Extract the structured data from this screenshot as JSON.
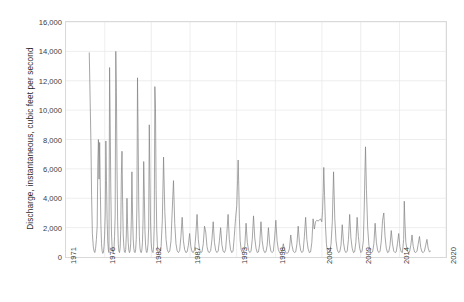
{
  "chart_data": {
    "type": "line",
    "title": "",
    "xlabel": "",
    "ylabel": "Discharge, instantaneous, cubic feet per second",
    "ylim": [
      0,
      16000
    ],
    "xlim": [
      1971,
      2020
    ],
    "grid": true,
    "legend": false,
    "legend_position": "none",
    "line_color": "#808080",
    "y_ticks": [
      "16,000",
      "14,000",
      "12,000",
      "10,000",
      "8,000",
      "6,000",
      "4,000",
      "2,000",
      "0"
    ],
    "y_tick_values": [
      16000,
      14000,
      12000,
      10000,
      8000,
      6000,
      4000,
      2000,
      0
    ],
    "x_ticks": [
      "1971",
      "1976",
      "1982",
      "1987",
      "1993",
      "1998",
      "2004",
      "2009",
      "2014",
      "2020"
    ],
    "x_tick_values": [
      1971,
      1976,
      1982,
      1987,
      1993,
      1998,
      2004,
      2009,
      2014,
      2020
    ],
    "series": [
      {
        "name": "Discharge, instantaneous",
        "x": [
          1974.0,
          1974.12,
          1974.22,
          1974.3,
          1974.4,
          1974.52,
          1974.62,
          1974.72,
          1974.82,
          1974.92,
          1975.02,
          1975.1,
          1975.18,
          1975.26,
          1975.34,
          1975.42,
          1975.5,
          1975.58,
          1975.66,
          1975.74,
          1975.82,
          1975.9,
          1975.98,
          1976.06,
          1976.14,
          1976.22,
          1976.3,
          1976.38,
          1976.46,
          1976.54,
          1976.62,
          1976.7,
          1976.78,
          1976.86,
          1976.94,
          1977.02,
          1977.1,
          1977.18,
          1977.26,
          1977.34,
          1977.42,
          1977.5,
          1977.58,
          1977.66,
          1977.74,
          1977.82,
          1977.9,
          1977.98,
          1978.06,
          1978.14,
          1978.22,
          1978.3,
          1978.38,
          1978.46,
          1978.54,
          1978.62,
          1978.7,
          1978.78,
          1978.86,
          1978.94,
          1979.02,
          1979.1,
          1979.18,
          1979.26,
          1979.34,
          1979.42,
          1979.5,
          1979.58,
          1979.66,
          1979.74,
          1979.82,
          1979.9,
          1979.98,
          1980.06,
          1980.14,
          1980.22,
          1980.3,
          1980.38,
          1980.46,
          1980.54,
          1980.62,
          1980.7,
          1980.78,
          1980.86,
          1980.94,
          1981.02,
          1981.1,
          1981.18,
          1981.26,
          1981.34,
          1981.42,
          1981.5,
          1981.58,
          1981.66,
          1981.74,
          1981.82,
          1981.9,
          1981.98,
          1982.06,
          1982.14,
          1982.22,
          1982.3,
          1982.38,
          1982.46,
          1982.54,
          1982.62,
          1982.7,
          1982.78,
          1982.86,
          1982.94,
          1983.1,
          1983.26,
          1983.42,
          1983.58,
          1983.74,
          1983.9,
          1984.06,
          1984.22,
          1984.38,
          1984.54,
          1984.7,
          1984.86,
          1985.02,
          1985.18,
          1985.34,
          1985.5,
          1985.66,
          1985.82,
          1985.98,
          1986.14,
          1986.3,
          1986.46,
          1986.62,
          1986.78,
          1986.94,
          1987.1,
          1987.26,
          1987.42,
          1987.58,
          1987.74,
          1987.9,
          1988.06,
          1988.22,
          1988.38,
          1988.54,
          1988.7,
          1988.86,
          1989.02,
          1989.18,
          1989.34,
          1989.5,
          1989.66,
          1989.82,
          1989.98,
          1990.14,
          1990.3,
          1990.46,
          1990.62,
          1990.78,
          1990.94,
          1991.1,
          1991.26,
          1991.42,
          1991.58,
          1991.74,
          1991.9,
          1992.06,
          1992.22,
          1992.38,
          1992.54,
          1992.7,
          1992.86,
          1993.02,
          1993.12,
          1993.2,
          1993.28,
          1993.36,
          1993.46,
          1993.58,
          1993.74,
          1993.9,
          1994.06,
          1994.22,
          1994.38,
          1994.54,
          1994.7,
          1994.86,
          1995.02,
          1995.18,
          1995.34,
          1995.5,
          1995.66,
          1995.82,
          1995.98,
          1996.14,
          1996.3,
          1996.46,
          1996.62,
          1996.78,
          1996.94,
          1997.1,
          1997.26,
          1997.42,
          1997.58,
          1997.74,
          1997.9,
          1998.06,
          1998.22,
          1998.38,
          1998.54,
          1998.7,
          1998.86,
          1999.02,
          1999.18,
          1999.34,
          1999.5,
          1999.66,
          1999.82,
          1999.98,
          2000.14,
          2000.3,
          2000.46,
          2000.62,
          2000.78,
          2000.94,
          2001.1,
          2001.26,
          2001.42,
          2001.58,
          2001.74,
          2001.9,
          2002.06,
          2002.22,
          2002.38,
          2002.54,
          2002.7,
          2002.86,
          2003.02,
          2003.18,
          2003.34,
          2003.5,
          2003.66,
          2003.82,
          2003.98,
          2004.08,
          2004.16,
          2004.24,
          2004.34,
          2004.46,
          2004.58,
          2004.7,
          2004.86,
          2005.02,
          2005.18,
          2005.34,
          2005.5,
          2005.66,
          2005.82,
          2005.98,
          2006.14,
          2006.3,
          2006.46,
          2006.62,
          2006.78,
          2006.94,
          2007.1,
          2007.26,
          2007.42,
          2007.58,
          2007.74,
          2007.9,
          2008.06,
          2008.22,
          2008.38,
          2008.54,
          2008.7,
          2008.86,
          2009.02,
          2009.18,
          2009.34,
          2009.46,
          2009.54,
          2009.62,
          2009.74,
          2009.9,
          2010.06,
          2010.22,
          2010.38,
          2010.54,
          2010.7,
          2010.86,
          2011.02,
          2011.18,
          2011.34,
          2011.5,
          2011.66,
          2011.82,
          2011.98,
          2012.14,
          2012.3,
          2012.46,
          2012.62,
          2012.78,
          2012.94,
          2013.1,
          2013.26,
          2013.42,
          2013.58,
          2013.74,
          2013.9,
          2014.06,
          2014.22,
          2014.38,
          2014.54,
          2014.62,
          2014.7,
          2014.82,
          2014.98,
          2015.14,
          2015.3,
          2015.46,
          2015.62,
          2015.78,
          2015.94,
          2016.1,
          2016.26,
          2016.42,
          2016.58,
          2016.74,
          2016.9,
          2017.06,
          2017.22,
          2017.38,
          2017.54,
          2017.7,
          2017.86,
          2018.0
        ],
        "y": [
          13900,
          10500,
          7600,
          4200,
          1600,
          700,
          400,
          300,
          600,
          1200,
          2100,
          6200,
          8000,
          5300,
          7800,
          4800,
          2200,
          900,
          400,
          250,
          300,
          700,
          1500,
          3000,
          7900,
          5200,
          2600,
          1100,
          500,
          300,
          12900,
          9000,
          4500,
          1700,
          700,
          350,
          300,
          500,
          1400,
          2800,
          14000,
          11200,
          6000,
          2400,
          900,
          400,
          300,
          600,
          1800,
          5600,
          7200,
          3800,
          1500,
          700,
          350,
          300,
          500,
          1500,
          4000,
          2200,
          1000,
          450,
          300,
          400,
          900,
          2500,
          5800,
          3000,
          1300,
          600,
          350,
          300,
          500,
          1200,
          3400,
          12200,
          8400,
          3600,
          1400,
          600,
          350,
          300,
          450,
          1000,
          2600,
          6500,
          4200,
          1800,
          800,
          400,
          300,
          450,
          900,
          2000,
          9000,
          5500,
          2400,
          1000,
          500,
          350,
          300,
          700,
          2200,
          11600,
          10100,
          4600,
          1900,
          800,
          400,
          300,
          350,
          700,
          2500,
          6800,
          3100,
          1200,
          500,
          300,
          400,
          1100,
          3200,
          5200,
          2300,
          900,
          400,
          300,
          450,
          1400,
          2700,
          1100,
          500,
          300,
          350,
          800,
          1600,
          700,
          350,
          300,
          500,
          1500,
          2900,
          1200,
          500,
          300,
          350,
          900,
          2100,
          1700,
          700,
          350,
          300,
          450,
          1200,
          2400,
          1000,
          450,
          300,
          400,
          1100,
          2000,
          850,
          400,
          300,
          500,
          1600,
          2900,
          1200,
          500,
          300,
          400,
          1400,
          2600,
          3500,
          5200,
          6600,
          4800,
          2600,
          1100,
          500,
          300,
          350,
          800,
          2300,
          1000,
          450,
          300,
          400,
          1200,
          2800,
          1300,
          600,
          300,
          350,
          900,
          2400,
          1100,
          500,
          300,
          350,
          800,
          2000,
          900,
          400,
          300,
          400,
          1300,
          2500,
          1100,
          500,
          300,
          300,
          400,
          900,
          500,
          300,
          250,
          300,
          600,
          1500,
          800,
          400,
          300,
          350,
          900,
          2100,
          1000,
          450,
          300,
          400,
          1400,
          2700,
          1200,
          550,
          300,
          350,
          1000,
          2600,
          1900,
          2400,
          2500,
          2450,
          2500,
          2600,
          2400,
          3100,
          4400,
          6100,
          4200,
          2100,
          900,
          400,
          300,
          350,
          900,
          2400,
          5800,
          2600,
          1100,
          500,
          300,
          350,
          800,
          2200,
          1000,
          450,
          300,
          400,
          1200,
          2900,
          1300,
          600,
          300,
          350,
          1000,
          2700,
          1400,
          600,
          300,
          400,
          1100,
          3400,
          5600,
          7500,
          4600,
          2000,
          800,
          400,
          300,
          350,
          900,
          2300,
          1000,
          450,
          300,
          400,
          1100,
          2500,
          3000,
          1400,
          600,
          300,
          350,
          800,
          1800,
          900,
          400,
          300,
          350,
          900,
          1600,
          700,
          350,
          300,
          1200,
          3800,
          2400,
          1000,
          450,
          300,
          350,
          800,
          1500,
          700,
          350,
          300,
          400,
          900,
          1400,
          650,
          350,
          300,
          400,
          800,
          1200,
          600,
          350,
          400
        ]
      }
    ]
  }
}
